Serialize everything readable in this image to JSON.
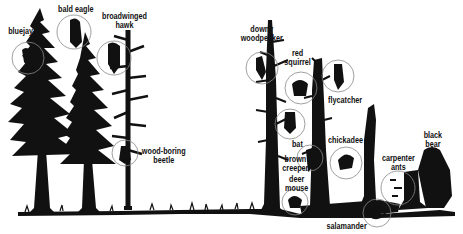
{
  "diagram": {
    "type": "wildlife-habitat-illustration",
    "colors": {
      "ink": "#111111",
      "background": "#ffffff",
      "circle": "#888888"
    },
    "sections": [
      {
        "name": "living-conifers",
        "description": "tall living evergreen trees"
      },
      {
        "name": "snags",
        "description": "dead standing trees, stumps and fallen logs"
      }
    ],
    "labels": [
      {
        "id": "bluejay",
        "lines": [
          "bluejay"
        ]
      },
      {
        "id": "bald-eagle",
        "lines": [
          "bald eagle"
        ]
      },
      {
        "id": "broadwinged-hawk",
        "lines": [
          "broadwinged",
          "hawk"
        ]
      },
      {
        "id": "wood-boring-beetle",
        "lines": [
          "wood-boring",
          "beetle"
        ]
      },
      {
        "id": "downy-woodpecker",
        "lines": [
          "downy",
          "woodpecker"
        ]
      },
      {
        "id": "red-squirrel",
        "lines": [
          "red",
          "squirrel"
        ]
      },
      {
        "id": "flycatcher",
        "lines": [
          "flycatcher"
        ]
      },
      {
        "id": "bat",
        "lines": [
          "bat"
        ]
      },
      {
        "id": "chickadee",
        "lines": [
          "chickadee"
        ]
      },
      {
        "id": "brown-creeper",
        "lines": [
          "brown",
          "creeper"
        ]
      },
      {
        "id": "deer-mouse",
        "lines": [
          "deer",
          "mouse"
        ]
      },
      {
        "id": "salamander",
        "lines": [
          "salamander"
        ]
      },
      {
        "id": "carpenter-ants",
        "lines": [
          "carpenter",
          "ants"
        ]
      },
      {
        "id": "black-bear",
        "lines": [
          "black",
          "bear"
        ]
      }
    ]
  }
}
